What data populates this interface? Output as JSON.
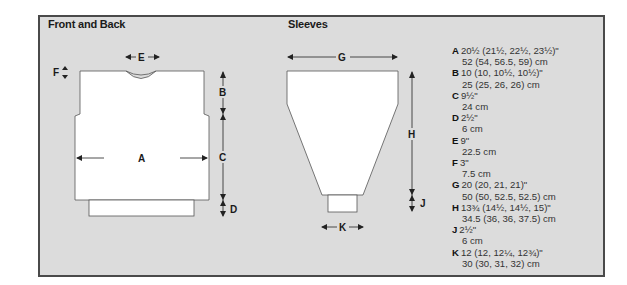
{
  "front_back": {
    "title": "Front and Back",
    "labels": {
      "A": "A",
      "B": "B",
      "C": "C",
      "D": "D",
      "E": "E",
      "F": "F"
    }
  },
  "sleeves": {
    "title": "Sleeves",
    "labels": {
      "G": "G",
      "H": "H",
      "J": "J",
      "K": "K"
    }
  },
  "measurements": [
    {
      "key": "A",
      "imperial": "20½ (21½, 22½, 23½)\"",
      "metric": "52 (54, 56.5, 59) cm"
    },
    {
      "key": "B",
      "imperial": "10 (10, 10½, 10½)\"",
      "metric": "25 (25, 26, 26) cm"
    },
    {
      "key": "C",
      "imperial": "9½\"",
      "metric": "24 cm"
    },
    {
      "key": "D",
      "imperial": "2½\"",
      "metric": "6 cm"
    },
    {
      "key": "E",
      "imperial": "9\"",
      "metric": "22.5 cm"
    },
    {
      "key": "F",
      "imperial": "3\"",
      "metric": "7.5 cm"
    },
    {
      "key": "G",
      "imperial": "20 (20, 21, 21)\"",
      "metric": "50 (50, 52.5, 52.5) cm"
    },
    {
      "key": "H",
      "imperial": "13¾ (14½, 14½, 15)\"",
      "metric": "34.5 (36, 36, 37.5) cm"
    },
    {
      "key": "J",
      "imperial": "2½\"",
      "metric": "6 cm"
    },
    {
      "key": "K",
      "imperial": "12 (12, 12¼, 12¾)\"",
      "metric": "30 (30, 31, 32) cm"
    }
  ],
  "colors": {
    "panel": "#dcdcdc",
    "border": "#4a4a4a",
    "piece": "#ffffff",
    "line": "#333333"
  }
}
